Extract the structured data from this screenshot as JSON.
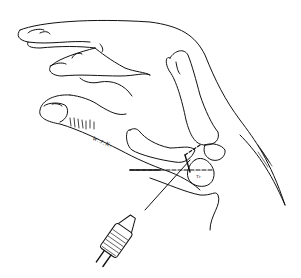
{
  "illustration": {
    "subject": "hand with thumb metacarpal and carpal bones, drill with K-wire",
    "signature": "W.J.K.",
    "bone_labels": [
      "Tr",
      "Tz"
    ],
    "colors": {
      "line": "#111111",
      "background": "#ffffff"
    }
  }
}
